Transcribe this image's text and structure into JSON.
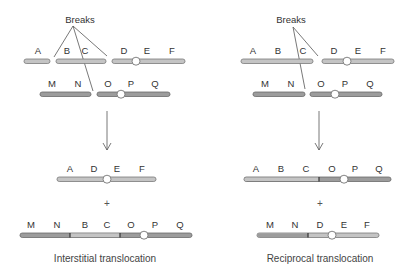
{
  "colors": {
    "chromosome_1": "#c4c4c4",
    "chromosome_2": "#9c9c9c",
    "centromere": "#ffffff"
  },
  "left_panel": {
    "breaks_label": "Breaks",
    "before": {
      "chromosome_1_labels": [
        "A",
        "B",
        "C",
        "D",
        "E",
        "F"
      ],
      "chromosome_2_labels": [
        "M",
        "N",
        "O",
        "P",
        "Q"
      ]
    },
    "after": {
      "product_1_labels": [
        "A",
        "D",
        "E",
        "F"
      ],
      "plus": "+",
      "product_2_labels": [
        "M",
        "N",
        "B",
        "C",
        "O",
        "P",
        "Q"
      ]
    },
    "caption": "Interstitial translocation"
  },
  "right_panel": {
    "breaks_label": "Breaks",
    "before": {
      "chromosome_1_labels": [
        "A",
        "B",
        "C",
        "D",
        "E",
        "F"
      ],
      "chromosome_2_labels": [
        "M",
        "N",
        "O",
        "P",
        "Q"
      ]
    },
    "after": {
      "product_1_labels": [
        "A",
        "B",
        "C",
        "O",
        "P",
        "Q"
      ],
      "plus": "+",
      "product_2_labels": [
        "M",
        "N",
        "D",
        "E",
        "F"
      ]
    },
    "caption": "Reciprocal translocation"
  }
}
